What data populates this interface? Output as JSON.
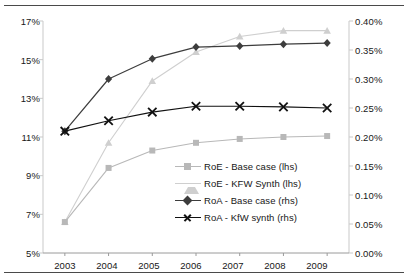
{
  "chart_data": {
    "type": "line",
    "title": "",
    "subtitle": "",
    "xlabel": "",
    "ylabel": "",
    "grid": false,
    "legend_position": "inside-center",
    "categories": [
      "2003",
      "2004",
      "2005",
      "2006",
      "2007",
      "2008",
      "2009"
    ],
    "x_tick_labels": [
      "2003",
      "2004",
      "2005",
      "2006",
      "2007",
      "2008",
      "2009"
    ],
    "axes": {
      "left": {
        "name": "lhs",
        "ylim": [
          5,
          17
        ],
        "tick_labels": [
          "17%",
          "15%",
          "13%",
          "11%",
          "9%",
          "7%",
          "5%"
        ],
        "tick_values": [
          17,
          15,
          13,
          11,
          9,
          7,
          5
        ],
        "unit": "%"
      },
      "right": {
        "name": "rhs",
        "ylim": [
          0.0,
          0.4
        ],
        "tick_labels": [
          "0.40%",
          "0.35%",
          "0.30%",
          "0.25%",
          "0.20%",
          "0.15%",
          "0.10%",
          "0.05%",
          "0.00%"
        ],
        "tick_values": [
          0.4,
          0.35,
          0.3,
          0.25,
          0.2,
          0.15,
          0.1,
          0.05,
          0.0
        ],
        "unit": "%"
      }
    },
    "series": [
      {
        "name": "RoE - Base case (lhs)",
        "axis": "left",
        "marker": "square",
        "color": "#b8b8b8",
        "values": [
          6.6,
          9.4,
          10.3,
          10.7,
          10.9,
          11.0,
          11.05
        ]
      },
      {
        "name": "RoE - KFW Synth (lhs)",
        "axis": "left",
        "marker": "triangle",
        "color": "#cfcfcf",
        "values": [
          6.6,
          10.7,
          13.9,
          15.4,
          16.2,
          16.5,
          16.5
        ]
      },
      {
        "name": "RoA - Base case (rhs)",
        "axis": "right",
        "marker": "diamond",
        "color": "#3d3d3d",
        "values": [
          0.21,
          0.3,
          0.335,
          0.355,
          0.357,
          0.36,
          0.362
        ]
      },
      {
        "name": "RoA - KfW synth (rhs)",
        "axis": "right",
        "marker": "x",
        "color": "#111111",
        "values": [
          0.21,
          0.228,
          0.243,
          0.253,
          0.253,
          0.252,
          0.25
        ]
      }
    ],
    "legend_entries": [
      {
        "label": "RoE - Base case (lhs)",
        "marker": "square",
        "color": "#b8b8b8"
      },
      {
        "label": "RoE - KFW Synth (lhs)",
        "marker": "triangle",
        "color": "#cfcfcf"
      },
      {
        "label": "RoA - Base case (rhs)",
        "marker": "diamond",
        "color": "#3d3d3d"
      },
      {
        "label": "RoA - KfW synth (rhs)",
        "marker": "x",
        "color": "#111111"
      }
    ]
  }
}
